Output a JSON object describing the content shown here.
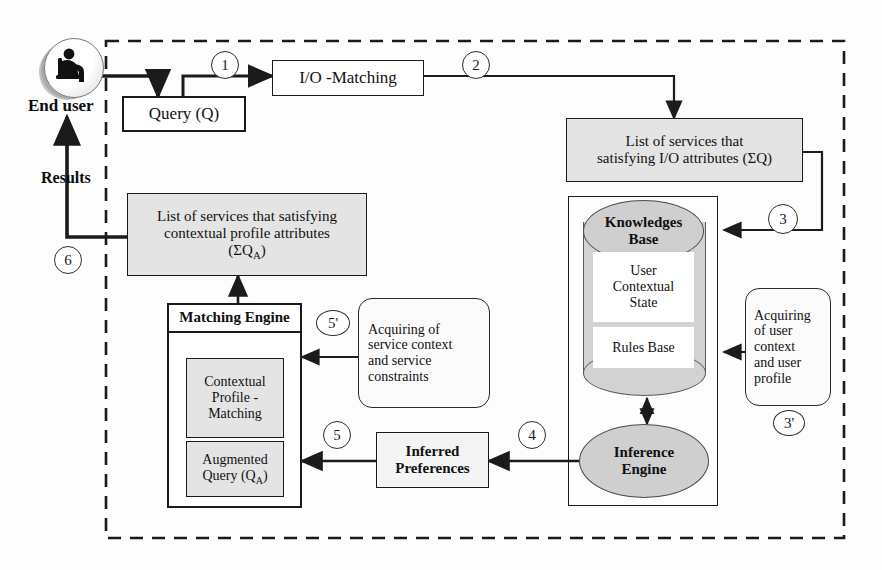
{
  "diagram": {
    "system_boundary": {
      "style": "dashed",
      "color": "#1a1a1a"
    },
    "actor": {
      "name": "end-user",
      "label": "End user",
      "icon": "user-at-computer-icon",
      "return_label": "Results"
    },
    "nodes": {
      "query": {
        "label": "Query (Q)",
        "fill": "#ffffff"
      },
      "io_matching": {
        "label": "I/O -Matching",
        "fill": "#ffffff"
      },
      "list_io": {
        "line1": "List of services that",
        "line2": "satisfying I/O attributes (ΣQ)",
        "fill": "#e4e4e4"
      },
      "list_ctx": {
        "line1": "List of services that satisfying",
        "line2": "contextual profile attributes",
        "line3_prefix": "(ΣQ",
        "line3_sub": "A",
        "line3_suffix": ")",
        "fill": "#e4e4e4"
      },
      "knowledges_base": {
        "label_line1": "Knowledges",
        "label_line2": "Base",
        "fill": "#cfcfcf"
      },
      "user_contextual_state": {
        "line1": "User",
        "line2": "Contextual",
        "line3": "State",
        "fill": "#ffffff"
      },
      "rules_base": {
        "label": "Rules Base",
        "fill": "#ffffff"
      },
      "inference_engine": {
        "label_line1": "Inference",
        "label_line2": "Engine",
        "fill": "#cfcfcf"
      },
      "acquiring_user": {
        "line1": "Acquiring",
        "line2": "of user",
        "line3": "context",
        "line4": "and user",
        "line5": "profile"
      },
      "acquiring_service": {
        "line1": "Acquiring of",
        "line2": "service context",
        "line3": "and service",
        "line4": "constraints"
      },
      "inferred_preferences": {
        "line1": "Inferred",
        "line2": "Preferences",
        "fill": "#f2f2f2"
      },
      "matching_engine": {
        "title": "Matching Engine"
      },
      "contextual_profile_matching": {
        "line1": "Contextual",
        "line2": "Profile -",
        "line3": "Matching",
        "fill": "#e4e4e4"
      },
      "augmented_query": {
        "line1": "Augmented",
        "line2_prefix": "Query (Q",
        "line2_sub": "A",
        "line2_suffix": ")",
        "fill": "#e4e4e4"
      }
    },
    "flow_numbers": [
      {
        "id": "n1",
        "label": "1"
      },
      {
        "id": "n2",
        "label": "2"
      },
      {
        "id": "n3",
        "label": "3"
      },
      {
        "id": "n3p",
        "label": "3'"
      },
      {
        "id": "n4",
        "label": "4"
      },
      {
        "id": "n5",
        "label": "5"
      },
      {
        "id": "n5p",
        "label": "5'"
      },
      {
        "id": "n6",
        "label": "6"
      }
    ]
  }
}
